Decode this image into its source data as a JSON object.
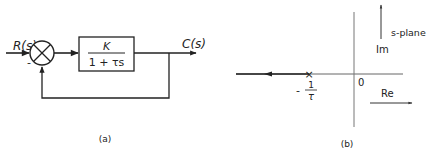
{
  "figure_a": {
    "caption": "(a)",
    "input_label": "R(s)",
    "output_label": "C(s)",
    "plus_sign": "+",
    "minus_sign": "-",
    "block": {
      "numerator": "K",
      "denominator": "1 + τs"
    }
  },
  "figure_b": {
    "caption": "(b)",
    "plane_label": "s-plane",
    "imag_axis_label": "Im",
    "real_axis_label": "Re",
    "origin_label": "0",
    "pole_marker": "×",
    "pole_label_sign": "-",
    "pole_label_numerator": "1",
    "pole_label_denominator": "τ"
  },
  "colors": {
    "stroke": "#222222",
    "axis": "#555555",
    "background": "#ffffff"
  }
}
